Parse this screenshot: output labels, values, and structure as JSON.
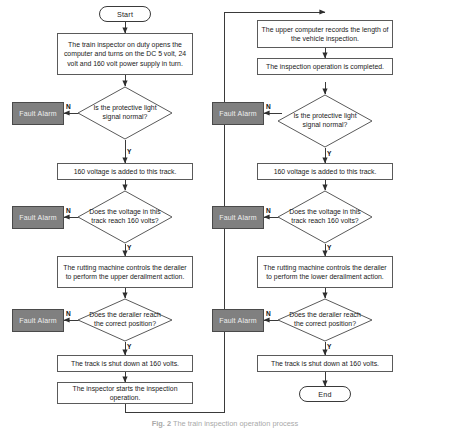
{
  "figure": {
    "caption_label": "Fig. 2",
    "caption_text": "The train inspection operation process",
    "type": "flowchart",
    "orientation": "two-column, left column flows into right column"
  },
  "palette": {
    "page_background": "#ffffff",
    "node_border": "#5a5a5a",
    "terminator_border": "#3a3a3a",
    "fault_fill": "#808080",
    "fault_text": "#efefef",
    "connector": "#3a3a3a",
    "text": "#1a1a1a"
  },
  "left_column": {
    "start": {
      "label": "Start",
      "shape": "terminator"
    },
    "step_power_on": {
      "label": "The train inspector on duty opens the computer and turns on the DC 5 volt, 24 volt and 160 volt power supply in turn.",
      "shape": "process"
    },
    "decision_light_signal": {
      "label": "Is the protective light signal normal?",
      "shape": "decision",
      "yes_label": "Y",
      "no_label": "N"
    },
    "fault_alarm_1": {
      "label": "Fault Alarm",
      "shape": "fault"
    },
    "step_add_160": {
      "label": "160 voltage is added to this track.",
      "shape": "process"
    },
    "decision_voltage": {
      "label": "Does the voltage in this track reach 160 volts?",
      "shape": "decision",
      "yes_label": "Y",
      "no_label": "N"
    },
    "fault_alarm_2": {
      "label": "Fault Alarm",
      "shape": "fault"
    },
    "step_rutting_machine": {
      "label": "The rutting machine controls the derailer to perform the upper derailment action.",
      "shape": "process"
    },
    "decision_derailer": {
      "label": "Does the derailer reach the correct position?",
      "shape": "decision",
      "yes_label": "Y",
      "no_label": "N"
    },
    "fault_alarm_3": {
      "label": "Fault Alarm",
      "shape": "fault"
    },
    "step_shut_down": {
      "label": "The track is shut down at 160 volts.",
      "shape": "process"
    },
    "step_start_inspection": {
      "label": "The inspector starts the inspection operation.",
      "shape": "process"
    }
  },
  "right_column": {
    "step_record_length": {
      "label": "The upper computer records the length of the vehicle inspection.",
      "shape": "process"
    },
    "step_inspection_completed": {
      "label": "The inspection operation is completed.",
      "shape": "process"
    },
    "decision_light_signal": {
      "label": "Is the protective light signal normal?",
      "shape": "decision",
      "yes_label": "Y",
      "no_label": "N"
    },
    "fault_alarm_1": {
      "label": "Fault Alarm",
      "shape": "fault"
    },
    "step_add_160": {
      "label": "160 voltage is added to this track.",
      "shape": "process"
    },
    "decision_voltage": {
      "label": "Does the voltage in this track reach 160 volts?",
      "shape": "decision",
      "yes_label": "Y",
      "no_label": "N"
    },
    "fault_alarm_2": {
      "label": "Fault Alarm",
      "shape": "fault"
    },
    "step_rutting_machine": {
      "label": "The rutting machine controls the derailer to perform the lower derailment action.",
      "shape": "process"
    },
    "decision_derailer": {
      "label": "Does the derailer reach the correct position?",
      "shape": "decision",
      "yes_label": "Y",
      "no_label": "N"
    },
    "fault_alarm_3": {
      "label": "Fault Alarm",
      "shape": "fault"
    },
    "step_shut_down": {
      "label": "The track is shut down at 160 volts.",
      "shape": "process"
    },
    "end": {
      "label": "End",
      "shape": "terminator"
    }
  }
}
